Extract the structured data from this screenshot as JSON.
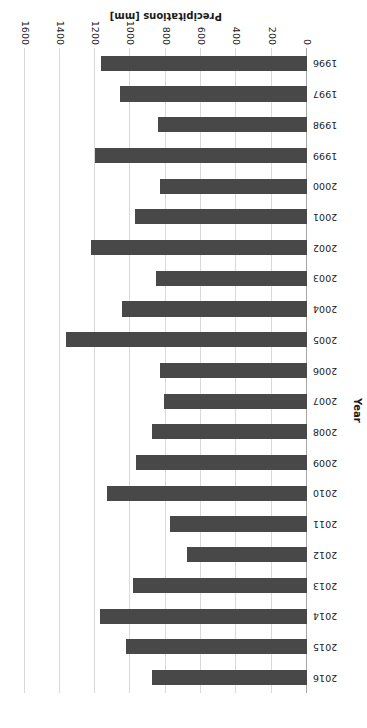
{
  "chart_data": {
    "type": "bar",
    "orientation": "horizontal",
    "title": "",
    "xlabel": "Precipitations [mm]",
    "ylabel": "Year",
    "xlim": [
      0,
      1600
    ],
    "xticks": [
      0,
      200,
      400,
      600,
      800,
      1000,
      1200,
      1400,
      1600
    ],
    "grid": true,
    "legend": false,
    "bar_color": "#484848",
    "gridline_color": "#d9d9d9",
    "axis_color": "#a6a6a6",
    "categories": [
      "1996",
      "1997",
      "1998",
      "1999",
      "2000",
      "2001",
      "2002",
      "2003",
      "2004",
      "2005",
      "2006",
      "2007",
      "2008",
      "2009",
      "2010",
      "2011",
      "2012",
      "2013",
      "2014",
      "2015",
      "2016"
    ],
    "values": [
      1165,
      1060,
      845,
      1200,
      835,
      975,
      1225,
      855,
      1050,
      1365,
      835,
      810,
      880,
      970,
      1135,
      775,
      680,
      985,
      1170,
      1025,
      880
    ],
    "series": [
      {
        "name": "Precipitations",
        "values": [
          1165,
          1060,
          845,
          1200,
          835,
          975,
          1225,
          855,
          1050,
          1365,
          835,
          810,
          880,
          970,
          1135,
          775,
          680,
          985,
          1170,
          1025,
          880
        ]
      }
    ],
    "page_orientation": "rotated-180"
  }
}
